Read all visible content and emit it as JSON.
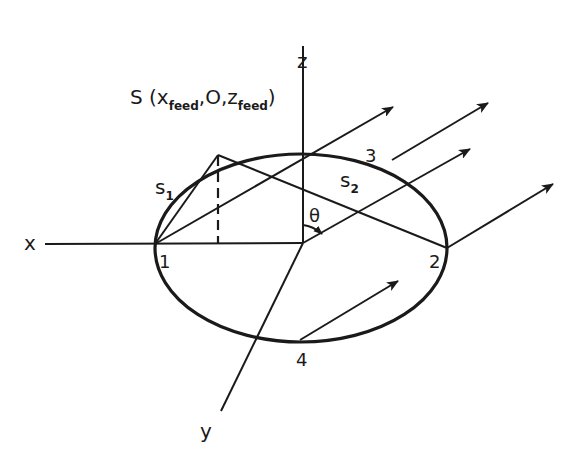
{
  "figure": {
    "feed_label": {
      "prefix": "S (x",
      "sub1": "feed",
      "mid": ",O,z",
      "sub2": "feed",
      "suffix": ")"
    },
    "axes": {
      "x": "x",
      "y": "y",
      "z": "z"
    },
    "angle_label": "θ",
    "path_labels": {
      "s1": "s",
      "s1_sub": "1",
      "s2": "s",
      "s2_sub": "2"
    },
    "points": [
      "1",
      "2",
      "3",
      "4"
    ],
    "colors": {
      "ink": "#1a1a1a",
      "background": "#ffffff"
    }
  }
}
